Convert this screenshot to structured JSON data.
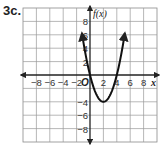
{
  "problem_label": "3c.",
  "chart_data": {
    "type": "line",
    "title": "",
    "function": "x^2 - 4x",
    "xlabel": "x",
    "ylabel": "f(x)",
    "origin_label": "O",
    "xlim": [
      -10,
      10
    ],
    "ylim": [
      -10,
      10
    ],
    "grid": true,
    "grid_step": 2,
    "x_ticks": [
      -8,
      -6,
      -4,
      -2,
      2,
      4,
      6,
      8
    ],
    "x_tick_labels": [
      "−8",
      "−6",
      "−4",
      "−2",
      "2",
      "4",
      "6",
      "8"
    ],
    "y_ticks": [
      8,
      6,
      4,
      2,
      -4,
      -6,
      -8
    ],
    "y_tick_labels": [
      "8",
      "6",
      "4",
      "2",
      "−4",
      "−6",
      "−8"
    ],
    "series": [
      {
        "name": "f(x)",
        "points": [
          [
            -1.2,
            6.24
          ],
          [
            -1,
            5
          ],
          [
            0,
            0
          ],
          [
            1,
            -3
          ],
          [
            2,
            -4
          ],
          [
            3,
            -3
          ],
          [
            4,
            0
          ],
          [
            5,
            5
          ],
          [
            5.2,
            6.24
          ]
        ],
        "vertex": [
          2,
          -4
        ],
        "roots": [
          0,
          4
        ],
        "arrows_at_ends": true
      }
    ]
  }
}
